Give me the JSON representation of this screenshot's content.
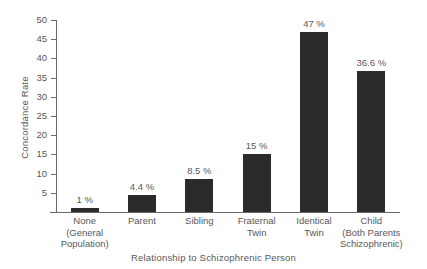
{
  "chart_data": {
    "type": "bar",
    "title": "",
    "xlabel": "Relationship to Schizophrenic Person",
    "ylabel": "Concordance Rate",
    "ylim": [
      0,
      50
    ],
    "ytick_step": 5,
    "grid": false,
    "legend": null,
    "bar_color": "#2b2b2b",
    "categories": [
      "None\n(General\nPopulation)",
      "Parent",
      "Sibling",
      "Fraternal\nTwin",
      "Identical\nTwin",
      "Child\n(Both Parents\nSchizophrenic)"
    ],
    "values": [
      1,
      4.4,
      8.5,
      15,
      47,
      36.6
    ],
    "value_labels": [
      "1 %",
      "4.4 %",
      "8.5 %",
      "15 %",
      "47 %",
      "36.6 %"
    ],
    "yticks": [
      "0",
      "5",
      "10",
      "15",
      "20",
      "25",
      "30",
      "35",
      "40",
      "45",
      "50"
    ]
  }
}
